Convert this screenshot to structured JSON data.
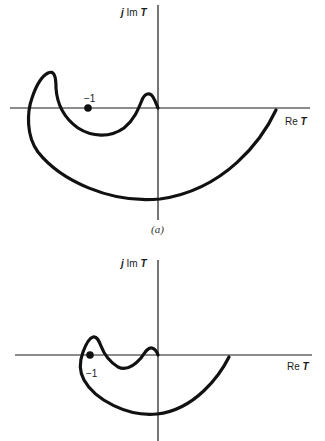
{
  "figure": {
    "plots": [
      {
        "id": "a",
        "y_axis_label_j": "j",
        "y_axis_label_im": "Im",
        "y_axis_label_T": "T",
        "x_axis_label_re": "Re",
        "x_axis_label_T": "T",
        "critical_point_label": "−1",
        "caption": "(a)"
      },
      {
        "id": "b",
        "y_axis_label_j": "j",
        "y_axis_label_im": "Im",
        "y_axis_label_T": "T",
        "x_axis_label_re": "Re",
        "x_axis_label_T": "T",
        "critical_point_label": "−1"
      }
    ],
    "colors": {
      "ink": "#111111",
      "background": "#ffffff"
    }
  }
}
